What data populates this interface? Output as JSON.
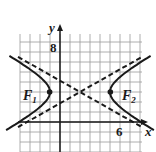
{
  "diagram": {
    "type": "hyperbola-graph",
    "axes": {
      "x_label": "x",
      "y_label": "y"
    },
    "tick_labels": {
      "y": "8",
      "x": "6"
    },
    "foci": [
      {
        "label": "F",
        "sub": "1"
      },
      {
        "label": "F",
        "sub": "2"
      }
    ],
    "geometry": {
      "unit_px": 10,
      "origin_px": [
        60,
        122
      ],
      "center": [
        2,
        3
      ],
      "a": 3,
      "b": 1.7,
      "grid_x_range": [
        -4,
        8
      ],
      "grid_y_range": [
        -3,
        9
      ]
    },
    "colors": {
      "ink": "#1a1a1a",
      "grid": "#9a9a9a",
      "background": "#ffffff"
    }
  }
}
